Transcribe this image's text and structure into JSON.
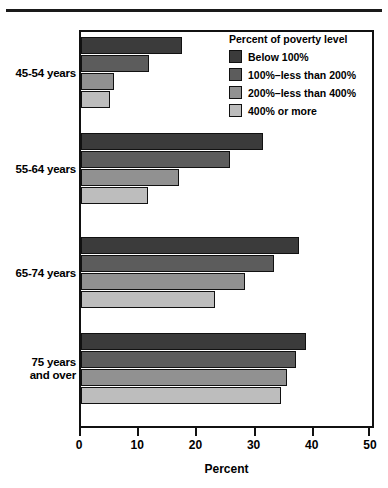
{
  "chart_data": {
    "type": "bar",
    "orientation": "horizontal",
    "title": "",
    "xlabel": "Percent",
    "ylabel": "",
    "xlim": [
      0,
      50
    ],
    "xticks": [
      0,
      10,
      20,
      30,
      40,
      50
    ],
    "xticklabels": [
      "0",
      "10",
      "20",
      "30",
      "40",
      "50"
    ],
    "grid": false,
    "categories": [
      "45-54 years",
      "55-64 years",
      "65-74 years",
      "75 years and over"
    ],
    "legend_title": "Percent of poverty level",
    "legend_position": "top-right-inside",
    "series": [
      {
        "name": "Below 100%",
        "color": "#3b3b3b",
        "values": [
          17.4,
          31.2,
          37.5,
          38.6
        ]
      },
      {
        "name": "100%–less than 200%",
        "color": "#5c5c5c",
        "values": [
          11.7,
          25.6,
          33.2,
          37.0
        ]
      },
      {
        "name": "200%–less than 400%",
        "color": "#919191",
        "values": [
          5.6,
          16.8,
          28.1,
          35.4
        ]
      },
      {
        "name": "400% or more",
        "color": "#bdbdbd",
        "values": [
          4.9,
          11.5,
          23.0,
          34.4
        ]
      }
    ]
  },
  "axis": {
    "x_title": "Percent"
  },
  "categories_display": [
    {
      "line1": "45-54 years",
      "line2": ""
    },
    {
      "line1": "55-64 years",
      "line2": ""
    },
    {
      "line1": "65-74 years",
      "line2": ""
    },
    {
      "line1": "75 years",
      "line2": "and over"
    }
  ]
}
